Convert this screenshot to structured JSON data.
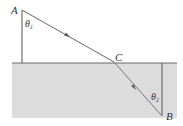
{
  "diagram": {
    "type": "refraction-path",
    "points": {
      "A": {
        "label": "A",
        "x": 22,
        "y": 10
      },
      "C": {
        "label": "C",
        "x": 114,
        "y": 62
      },
      "B": {
        "label": "B",
        "x": 162,
        "y": 116
      }
    },
    "angles": {
      "theta1": {
        "symbol": "θ",
        "sub": "1"
      },
      "theta2": {
        "symbol": "θ",
        "sub": "2"
      }
    },
    "colors": {
      "medium": "#dcdcdc",
      "line": "#555555",
      "ray": "#666666",
      "label": "#333333"
    }
  }
}
